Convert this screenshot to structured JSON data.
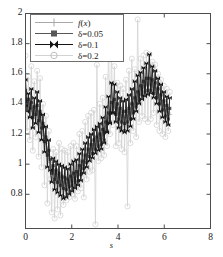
{
  "chart_data": {
    "type": "line",
    "title": "",
    "xlabel": "s",
    "ylabel": "",
    "xlim": [
      0,
      8
    ],
    "ylim": [
      0.573,
      2.0
    ],
    "xticks": [
      0,
      2,
      4,
      6,
      8
    ],
    "yticks": [
      0.8,
      1,
      1.2,
      1.4,
      1.6,
      1.8,
      2
    ],
    "xtick_labels": [
      "0",
      "2",
      "4",
      "6",
      "8"
    ],
    "ytick_labels": [
      "0.8",
      "1",
      "1.2",
      "1.4",
      "1.6",
      "1.8",
      "2"
    ],
    "grid": false,
    "legend_position": "upper-left",
    "legend_entries": [
      "f(x)",
      "δ=0.05",
      "δ=0.1",
      "δ=0.2"
    ],
    "series": [
      {
        "name": "f(x)",
        "color": "#a8a8a8",
        "marker": "plus",
        "x": [
          0,
          0.063,
          0.126,
          0.189,
          0.252,
          0.315,
          0.378,
          0.441,
          0.504,
          0.567,
          0.63,
          0.693,
          0.756,
          0.819,
          0.882,
          0.945,
          1.008,
          1.071,
          1.134,
          1.197,
          1.26,
          1.323,
          1.386,
          1.449,
          1.512,
          1.575,
          1.638,
          1.701,
          1.764,
          1.827,
          1.89,
          1.953,
          2.016,
          2.079,
          2.142,
          2.205,
          2.268,
          2.331,
          2.394,
          2.457,
          2.52,
          2.583,
          2.646,
          2.709,
          2.772,
          2.835,
          2.898,
          2.961,
          3.024,
          3.087,
          3.15,
          3.213,
          3.276,
          3.339,
          3.402,
          3.465,
          3.528,
          3.591,
          3.654,
          3.717,
          3.78,
          3.843,
          3.906,
          3.969,
          4.032,
          4.095,
          4.158,
          4.221,
          4.284,
          4.347,
          4.41,
          4.473,
          4.536,
          4.599,
          4.662,
          4.725,
          4.788,
          4.851,
          4.914,
          4.977,
          5.04,
          5.103,
          5.166,
          5.229,
          5.292,
          5.355,
          5.418,
          5.481,
          5.544,
          5.607,
          5.67,
          5.733,
          5.796,
          5.859,
          5.922,
          5.985,
          6.048,
          6.111,
          6.174,
          6.237
        ],
        "y": [
          1.46,
          1.43,
          1.4,
          1.41,
          1.37,
          1.35,
          1.34,
          1.36,
          1.35,
          1.33,
          1.31,
          1.28,
          1.24,
          1.19,
          1.14,
          1.1,
          1.05,
          1.01,
          0.98,
          0.96,
          0.94,
          0.93,
          0.92,
          0.91,
          0.9,
          0.89,
          0.88,
          0.88,
          0.87,
          0.87,
          0.88,
          0.88,
          0.89,
          0.9,
          0.91,
          0.92,
          0.93,
          0.95,
          0.97,
          0.99,
          1.01,
          1.03,
          1.05,
          1.07,
          1.09,
          1.1,
          1.11,
          1.12,
          1.13,
          1.14,
          1.15,
          1.16,
          1.17,
          1.19,
          1.21,
          1.24,
          1.27,
          1.3,
          1.33,
          1.36,
          1.38,
          1.38,
          1.37,
          1.36,
          1.34,
          1.33,
          1.32,
          1.31,
          1.31,
          1.31,
          1.32,
          1.33,
          1.34,
          1.36,
          1.38,
          1.4,
          1.42,
          1.44,
          1.46,
          1.48,
          1.5,
          1.51,
          1.52,
          1.53,
          1.53,
          1.53,
          1.53,
          1.52,
          1.51,
          1.5,
          1.48,
          1.46,
          1.44,
          1.42,
          1.4,
          1.38,
          1.36,
          1.35,
          1.34,
          1.33
        ]
      },
      {
        "name": "δ=0.05",
        "color": "#575757",
        "marker": "square",
        "x": [
          0,
          0.063,
          0.126,
          0.189,
          0.252,
          0.315,
          0.378,
          0.441,
          0.504,
          0.567,
          0.63,
          0.693,
          0.756,
          0.819,
          0.882,
          0.945,
          1.008,
          1.071,
          1.134,
          1.197,
          1.26,
          1.323,
          1.386,
          1.449,
          1.512,
          1.575,
          1.638,
          1.701,
          1.764,
          1.827,
          1.89,
          1.953,
          2.016,
          2.079,
          2.142,
          2.205,
          2.268,
          2.331,
          2.394,
          2.457,
          2.52,
          2.583,
          2.646,
          2.709,
          2.772,
          2.835,
          2.898,
          2.961,
          3.024,
          3.087,
          3.15,
          3.213,
          3.276,
          3.339,
          3.402,
          3.465,
          3.528,
          3.591,
          3.654,
          3.717,
          3.78,
          3.843,
          3.906,
          3.969,
          4.032,
          4.095,
          4.158,
          4.221,
          4.284,
          4.347,
          4.41,
          4.473,
          4.536,
          4.599,
          4.662,
          4.725,
          4.788,
          4.851,
          4.914,
          4.977,
          5.04,
          5.103,
          5.166,
          5.229,
          5.292,
          5.355,
          5.418,
          5.481,
          5.544,
          5.607,
          5.67,
          5.733,
          5.796,
          5.859,
          5.922,
          5.985,
          6.048,
          6.111,
          6.174,
          6.237
        ],
        "y": [
          1.49,
          1.39,
          1.43,
          1.37,
          1.41,
          1.31,
          1.38,
          1.33,
          1.39,
          1.29,
          1.35,
          1.24,
          1.27,
          1.15,
          1.18,
          1.06,
          1.09,
          1.03,
          0.94,
          0.99,
          0.9,
          0.96,
          0.88,
          0.94,
          0.86,
          0.92,
          0.84,
          0.91,
          0.83,
          0.9,
          0.85,
          0.92,
          0.86,
          0.94,
          0.88,
          0.95,
          0.89,
          0.99,
          0.93,
          1.02,
          0.97,
          1.06,
          1.01,
          1.1,
          1.05,
          1.13,
          1.07,
          1.16,
          1.1,
          1.18,
          1.12,
          1.2,
          1.13,
          1.23,
          1.16,
          1.28,
          1.22,
          1.34,
          1.28,
          1.41,
          1.34,
          1.43,
          1.33,
          1.4,
          1.3,
          1.37,
          1.28,
          1.35,
          1.27,
          1.35,
          1.28,
          1.37,
          1.3,
          1.4,
          1.34,
          1.44,
          1.38,
          1.48,
          1.42,
          1.52,
          1.46,
          1.55,
          1.48,
          1.57,
          1.49,
          1.57,
          1.49,
          1.56,
          1.47,
          1.54,
          1.44,
          1.5,
          1.4,
          1.46,
          1.36,
          1.42,
          1.32,
          1.39,
          1.3,
          1.37
        ]
      },
      {
        "name": "δ=0.1",
        "color": "#121212",
        "marker": "bowtie",
        "x": [
          0,
          0.063,
          0.126,
          0.189,
          0.252,
          0.315,
          0.378,
          0.441,
          0.504,
          0.567,
          0.63,
          0.693,
          0.756,
          0.819,
          0.882,
          0.945,
          1.008,
          1.071,
          1.134,
          1.197,
          1.26,
          1.323,
          1.386,
          1.449,
          1.512,
          1.575,
          1.638,
          1.701,
          1.764,
          1.827,
          1.89,
          1.953,
          2.016,
          2.079,
          2.142,
          2.205,
          2.268,
          2.331,
          2.394,
          2.457,
          2.52,
          2.583,
          2.646,
          2.709,
          2.772,
          2.835,
          2.898,
          2.961,
          3.024,
          3.087,
          3.15,
          3.213,
          3.276,
          3.339,
          3.402,
          3.465,
          3.528,
          3.591,
          3.654,
          3.717,
          3.78,
          3.843,
          3.906,
          3.969,
          4.032,
          4.095,
          4.158,
          4.221,
          4.284,
          4.347,
          4.41,
          4.473,
          4.536,
          4.599,
          4.662,
          4.725,
          4.788,
          4.851,
          4.914,
          4.977,
          5.04,
          5.103,
          5.166,
          5.229,
          5.292,
          5.355,
          5.418,
          5.481,
          5.544,
          5.607,
          5.67,
          5.733,
          5.796,
          5.859,
          5.922,
          5.985,
          6.048,
          6.111,
          6.174,
          6.237
        ],
        "y": [
          1.56,
          1.35,
          1.47,
          1.31,
          1.5,
          1.24,
          1.44,
          1.27,
          1.48,
          1.21,
          1.42,
          1.16,
          1.33,
          1.08,
          1.25,
          0.98,
          1.16,
          0.96,
          0.88,
          1.04,
          0.83,
          1.02,
          0.81,
          1.0,
          0.79,
          0.99,
          0.77,
          0.98,
          0.78,
          0.97,
          0.8,
          1.0,
          0.82,
          1.02,
          0.84,
          1.03,
          0.86,
          1.07,
          0.89,
          1.1,
          0.94,
          1.14,
          0.98,
          1.18,
          1.02,
          1.2,
          1.04,
          1.23,
          1.07,
          1.25,
          1.09,
          1.27,
          1.1,
          1.31,
          1.14,
          1.38,
          1.21,
          1.45,
          1.27,
          1.54,
          1.34,
          1.53,
          1.28,
          1.48,
          1.24,
          1.44,
          1.22,
          1.42,
          1.21,
          1.43,
          1.22,
          1.46,
          1.25,
          1.5,
          1.3,
          1.55,
          1.35,
          1.59,
          1.4,
          1.61,
          1.43,
          1.64,
          1.45,
          1.67,
          1.46,
          1.73,
          1.47,
          1.65,
          1.44,
          1.62,
          1.4,
          1.57,
          1.35,
          1.53,
          1.31,
          1.48,
          1.28,
          1.45,
          1.26,
          1.44
        ]
      },
      {
        "name": "δ=0.2",
        "color": "#d2d2d2",
        "marker": "circle",
        "x": [
          0,
          0.063,
          0.126,
          0.189,
          0.252,
          0.315,
          0.378,
          0.441,
          0.504,
          0.567,
          0.63,
          0.693,
          0.756,
          0.819,
          0.882,
          0.945,
          1.008,
          1.071,
          1.134,
          1.197,
          1.26,
          1.323,
          1.386,
          1.449,
          1.512,
          1.575,
          1.638,
          1.701,
          1.764,
          1.827,
          1.89,
          1.953,
          2.016,
          2.079,
          2.142,
          2.205,
          2.268,
          2.331,
          2.394,
          2.457,
          2.52,
          2.583,
          2.646,
          2.709,
          2.772,
          2.835,
          2.898,
          2.961,
          3.024,
          3.087,
          3.15,
          3.213,
          3.276,
          3.339,
          3.402,
          3.465,
          3.528,
          3.591,
          3.654,
          3.717,
          3.78,
          3.843,
          3.906,
          3.969,
          4.032,
          4.095,
          4.158,
          4.221,
          4.284,
          4.347,
          4.41,
          4.473,
          4.536,
          4.599,
          4.662,
          4.725,
          4.788,
          4.851,
          4.914,
          4.977,
          5.04,
          5.103,
          5.166,
          5.229,
          5.292,
          5.355,
          5.418,
          5.481,
          5.544,
          5.607,
          5.67,
          5.733,
          5.796,
          5.859,
          5.922,
          5.985,
          6.048,
          6.111,
          6.174,
          6.237
        ],
        "y": [
          1.72,
          1.22,
          1.58,
          1.16,
          1.65,
          1.09,
          1.55,
          1.18,
          1.62,
          1.05,
          1.57,
          0.98,
          1.4,
          0.86,
          1.32,
          0.74,
          1.22,
          0.9,
          0.68,
          1.1,
          0.64,
          1.08,
          0.7,
          1.14,
          0.66,
          1.1,
          0.73,
          1.09,
          0.76,
          1.08,
          0.78,
          1.12,
          0.8,
          1.14,
          0.77,
          1.12,
          0.82,
          1.2,
          0.84,
          1.22,
          0.78,
          1.28,
          0.9,
          1.32,
          0.95,
          1.34,
          0.96,
          1.36,
          0.6,
          1.66,
          1.02,
          1.4,
          1.04,
          1.44,
          1.06,
          1.58,
          1.12,
          1.81,
          1.2,
          1.76,
          1.26,
          1.65,
          1.12,
          1.54,
          1.14,
          1.52,
          1.1,
          1.5,
          1.08,
          1.56,
          0.72,
          1.62,
          1.14,
          1.7,
          1.22,
          1.63,
          1.18,
          1.96,
          1.28,
          1.7,
          1.32,
          1.72,
          1.3,
          1.74,
          1.28,
          1.73,
          1.3,
          1.68,
          1.34,
          1.66,
          1.26,
          1.6,
          1.22,
          1.56,
          1.2,
          1.52,
          1.18,
          1.5,
          1.22,
          1.48
        ]
      }
    ]
  },
  "axes": {
    "x_title": "s",
    "frame_color": "#4d4d4d"
  }
}
